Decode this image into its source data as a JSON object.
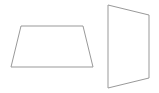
{
  "diagram": {
    "stroke_color": "#999999",
    "fill_color": "#ffffff",
    "shapes": [
      {
        "name": "trapezoid",
        "points": "21,26 83,26 93,67 11,67"
      },
      {
        "name": "quadrilateral-perspective",
        "points": "108,5 149,15 149,78 108,88"
      }
    ]
  }
}
